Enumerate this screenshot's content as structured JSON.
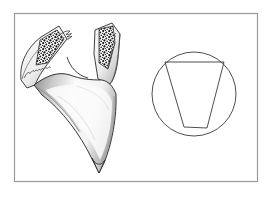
{
  "figure": {
    "domain": "scientific-illustration",
    "title": "Anatomical line drawing with schematic cross-section diagram",
    "background_color": "#ffffff",
    "canvas": {
      "width": 274,
      "height": 199
    },
    "border": {
      "name": "figure-border-frame",
      "x": 14,
      "y": 13,
      "width": 244,
      "height": 169,
      "stroke_color": "#9a9a9a",
      "stroke_width": 1.2,
      "fill": "#ffffff"
    },
    "panels": [
      {
        "id": "left-panel",
        "label": "Anatomical specimen drawing",
        "kind": "shaded-line-drawing",
        "description": "Y-shaped forked structure with two upward arms, each containing a dark stippled (trabecular) wedge, joined to a tapering shaded central body ending in a pointed tip"
      },
      {
        "id": "right-panel",
        "label": "Schematic cross-section diagram",
        "kind": "geometric-outline",
        "description": "Plain circle outline enclosing a tapered quadrilateral wedge whose two upper vertices meet the circle"
      }
    ],
    "left_drawing": {
      "name": "anatomical-specimen",
      "stroke_color": "#2b2b2b",
      "stipple_color": "#161616",
      "shading_color": "#8d8d8d",
      "left_arm": {
        "name": "left-arm",
        "outline": "M 22,78 C 20,62 28,48 40,38 L 58,27 L 66,38 L 52,56 C 44,66 38,74 34,84 Z",
        "stipple_region": "M 40,40 L 57,30 L 63,39 L 46,62 L 36,64 Z",
        "wavy_inner_edge": "M 25,76 C 30,70 36,62 44,54"
      },
      "right_arm": {
        "name": "right-arm",
        "outline": "M 96,28 L 112,24 L 118,36 L 116,60 L 110,80 L 98,76 L 94,52 Z",
        "stipple_region": "M 99,30 L 112,27 L 114,42 L 108,68 L 100,62 Z",
        "wavy_inner_edge": "M 114,34 C 115,48 113,62 108,76"
      },
      "central_body": {
        "name": "central-body",
        "outline": "M 34,84 C 46,76 60,72 72,76 C 84,80 96,78 110,80 L 116,100 C 116,122 112,146 104,164 L 98,172 L 90,160 C 78,136 62,112 44,96 Z",
        "highlight": "inner light area with soft gray gradient shading along left and lower-right edges",
        "tip": {
          "x": 98,
          "y": 172
        }
      },
      "notch": {
        "name": "central-notch",
        "path": "M 66,56 C 70,66 78,74 88,76"
      }
    },
    "right_diagram": {
      "name": "cross-section-schematic",
      "stroke_color": "#3a3a3a",
      "stroke_width": 0.9,
      "circle": {
        "name": "outer-circle",
        "cx": 194,
        "cy": 94,
        "r": 42
      },
      "wedge": {
        "name": "inner-wedge-polygon",
        "points": "165,62 224,62 207,128 184,127",
        "vertices": [
          {
            "name": "top-left-vertex",
            "x": 165,
            "y": 62
          },
          {
            "name": "top-right-vertex",
            "x": 224,
            "y": 62
          },
          {
            "name": "bottom-right-vertex",
            "x": 207,
            "y": 128
          },
          {
            "name": "bottom-left-vertex",
            "x": 184,
            "y": 127
          }
        ]
      }
    }
  }
}
